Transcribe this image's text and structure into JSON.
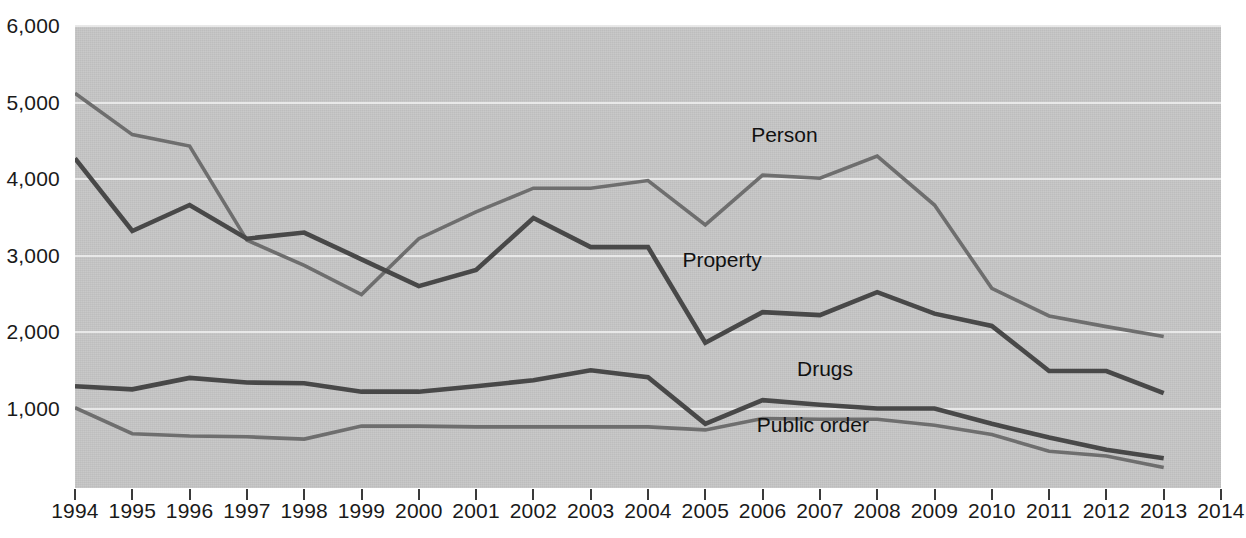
{
  "chart_data": {
    "type": "line",
    "title": "",
    "xlabel": "",
    "ylabel": "",
    "xlim": [
      1994,
      2014
    ],
    "ylim": [
      0,
      6000
    ],
    "grid": true,
    "legend_position": "inline-labels",
    "x": [
      1994,
      1995,
      1996,
      1997,
      1998,
      1999,
      2000,
      2001,
      2002,
      2003,
      2004,
      2005,
      2006,
      2007,
      2008,
      2009,
      2010,
      2011,
      2012,
      2013
    ],
    "xtick_labels": [
      "1994",
      "1995",
      "1996",
      "1997",
      "1998",
      "1999",
      "2000",
      "2001",
      "2002",
      "2003",
      "2004",
      "2005",
      "2006",
      "2007",
      "2008",
      "2009",
      "2010",
      "2011",
      "2012",
      "2013",
      "2014"
    ],
    "ytick_labels": [
      "6,000",
      "5,000",
      "4,000",
      "3,000",
      "2,000",
      "1,000"
    ],
    "ytick_values": [
      6000,
      5000,
      4000,
      3000,
      2000,
      1000
    ],
    "series": [
      {
        "name": "Person",
        "color": "#6e6e6e",
        "label_x": 2006,
        "values": [
          5120,
          4580,
          4430,
          3200,
          2870,
          2490,
          3220,
          3570,
          3880,
          3880,
          3980,
          3400,
          4050,
          4010,
          4300,
          3660,
          2570,
          2210,
          2070,
          1940
        ]
      },
      {
        "name": "Property",
        "color": "#484848",
        "label_x": 2005,
        "values": [
          4270,
          3320,
          3660,
          3220,
          3300,
          2950,
          2600,
          2810,
          3490,
          3110,
          3110,
          1860,
          2260,
          2220,
          2520,
          2240,
          2080,
          1490,
          1490,
          1200
        ]
      },
      {
        "name": "Drugs",
        "color": "#484848",
        "label_x": 2007,
        "values": [
          1290,
          1250,
          1400,
          1340,
          1330,
          1220,
          1220,
          1290,
          1370,
          1500,
          1410,
          800,
          1110,
          1050,
          1000,
          1000,
          800,
          620,
          460,
          350
        ]
      },
      {
        "name": "Public order",
        "color": "#6e6e6e",
        "label_x": 2007,
        "values": [
          1010,
          670,
          640,
          630,
          600,
          770,
          770,
          760,
          760,
          760,
          760,
          720,
          870,
          860,
          860,
          780,
          660,
          440,
          380,
          230
        ]
      }
    ]
  },
  "axes": {
    "y_tick_text": [
      "6,000",
      "5,000",
      "4,000",
      "3,000",
      "2,000",
      "1,000"
    ],
    "x_tick_text": [
      "1994",
      "1995",
      "1996",
      "1997",
      "1998",
      "1999",
      "2000",
      "2001",
      "2002",
      "2003",
      "2004",
      "2005",
      "2006",
      "2007",
      "2008",
      "2009",
      "2010",
      "2011",
      "2012",
      "2013",
      "2014"
    ]
  },
  "series_labels": {
    "person": "Person",
    "property": "Property",
    "drugs": "Drugs",
    "public_order": "Public order"
  },
  "colors": {
    "plot_background": "#c7c7c7",
    "gridline": "#efefef",
    "line_dark": "#484848",
    "line_light": "#6e6e6e",
    "text": "#1a1a1a"
  }
}
